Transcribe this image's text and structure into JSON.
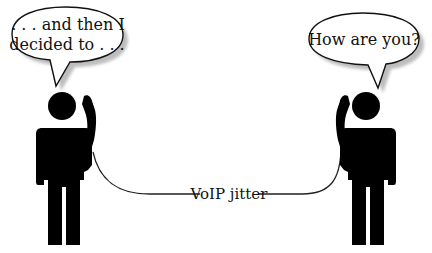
{
  "diagram": {
    "left_speech": {
      "line1": ". . . and then I",
      "line2": "decided to . . ."
    },
    "right_speech": {
      "line1": "How are you?"
    },
    "connection_label": "VoIP jitter",
    "colors": {
      "figure": "#000000",
      "bubble_fill": "#ffffff",
      "bubble_stroke": "#111111",
      "bubble_shadow": "#bdbdbd",
      "cord": "#222222"
    }
  }
}
